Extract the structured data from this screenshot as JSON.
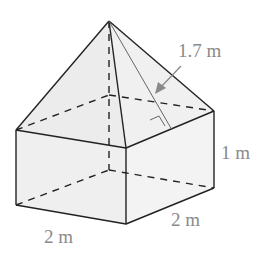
{
  "figure": {
    "labels": {
      "slant_height": "1.7 m",
      "prism_height": "1 m",
      "base_front": "2 m",
      "base_side": "2 m"
    },
    "colors": {
      "face_fill": "#efefef",
      "edge": "#222222",
      "label": "#8a8a8a",
      "arrow": "#8a8a8a"
    }
  }
}
